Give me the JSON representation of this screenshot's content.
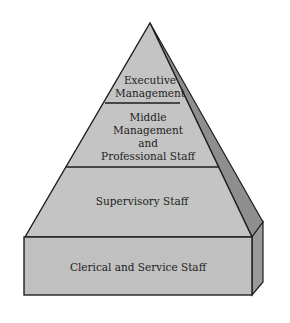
{
  "diagram": {
    "type": "pyramid",
    "colors": {
      "front_fill": "#c4c4c4",
      "side_fill": "#8e8e8e",
      "outline": "#1e1e1e",
      "text": "#222222",
      "background": "#ffffff"
    },
    "levels": [
      {
        "name": "executive",
        "lines": [
          "Executive",
          "Management"
        ]
      },
      {
        "name": "middle",
        "lines": [
          "Middle",
          "Management",
          "and",
          "Professional Staff"
        ]
      },
      {
        "name": "supervisory",
        "lines": [
          "Supervisory Staff"
        ]
      },
      {
        "name": "clerical",
        "lines": [
          "Clerical and Service Staff"
        ]
      }
    ]
  }
}
